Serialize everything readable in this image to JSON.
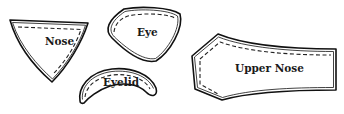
{
  "diagram": {
    "type": "sewing-pattern-pieces",
    "pieces": [
      {
        "id": "nose",
        "label": "Nose"
      },
      {
        "id": "eye",
        "label": "Eye"
      },
      {
        "id": "eyelid",
        "label": "Eyelid"
      },
      {
        "id": "upper-nose",
        "label": "Upper Nose"
      }
    ],
    "colors": {
      "line": "#111111",
      "background": "#ffffff"
    }
  }
}
